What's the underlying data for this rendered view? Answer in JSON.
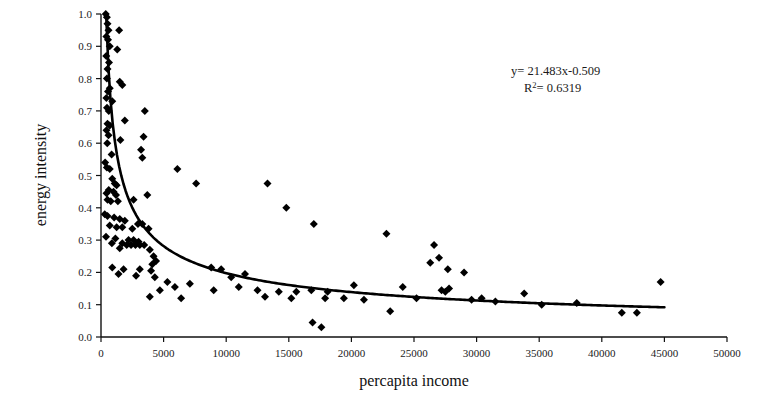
{
  "chart_data": {
    "type": "scatter",
    "title": "",
    "xlabel": "percapita income",
    "ylabel": "energy intensity",
    "xlim": [
      0,
      50000
    ],
    "ylim": [
      0,
      1.0
    ],
    "xticks": [
      0,
      5000,
      10000,
      15000,
      20000,
      25000,
      30000,
      35000,
      40000,
      45000,
      50000
    ],
    "xtick_labels": [
      "0",
      "5000",
      "10000",
      "15000",
      "20000",
      "25000",
      "30000",
      "35000",
      "40000",
      "45000",
      "50000"
    ],
    "yticks": [
      0.0,
      0.1,
      0.2,
      0.3,
      0.4,
      0.5,
      0.6,
      0.7,
      0.8,
      0.9,
      1.0
    ],
    "ytick_labels": [
      "0.0",
      "0.1",
      "0.2",
      "0.3",
      "0.4",
      "0.5",
      "0.6",
      "0.7",
      "0.8",
      "0.9",
      "1.0"
    ],
    "grid": false,
    "legend": "none",
    "marker": "diamond",
    "marker_color": "#000000",
    "marker_size": 4,
    "annotations": {
      "equation_prefix": "y= ",
      "equation_value": "21.483x-0.509",
      "equation": "y= 21.483x-0.509",
      "r_squared_prefix": "R",
      "r_squared_superscript": "2",
      "r_squared_value": "= 0.6319",
      "r_squared": "R2= 0.6319"
    },
    "trendline": {
      "type": "power",
      "coefficient": 21.483,
      "exponent": -0.509,
      "r_squared": 0.6319,
      "color": "#000000",
      "width": 2.6,
      "x_start": 420,
      "x_end": 45000
    },
    "series": [
      {
        "name": "energy intensity vs percapita income",
        "points": [
          [
            380,
            1.0
          ],
          [
            470,
            0.99
          ],
          [
            520,
            0.97
          ],
          [
            600,
            0.95
          ],
          [
            1450,
            0.95
          ],
          [
            430,
            0.93
          ],
          [
            560,
            0.92
          ],
          [
            700,
            0.9
          ],
          [
            1300,
            0.89
          ],
          [
            420,
            0.87
          ],
          [
            640,
            0.85
          ],
          [
            520,
            0.83
          ],
          [
            470,
            0.8
          ],
          [
            1500,
            0.79
          ],
          [
            1700,
            0.78
          ],
          [
            700,
            0.77
          ],
          [
            560,
            0.76
          ],
          [
            430,
            0.74
          ],
          [
            900,
            0.73
          ],
          [
            480,
            0.71
          ],
          [
            620,
            0.7
          ],
          [
            3500,
            0.7
          ],
          [
            1900,
            0.67
          ],
          [
            520,
            0.66
          ],
          [
            700,
            0.655
          ],
          [
            440,
            0.64
          ],
          [
            600,
            0.625
          ],
          [
            3400,
            0.62
          ],
          [
            1550,
            0.61
          ],
          [
            500,
            0.6
          ],
          [
            3200,
            0.58
          ],
          [
            850,
            0.565
          ],
          [
            3300,
            0.555
          ],
          [
            330,
            0.54
          ],
          [
            470,
            0.525
          ],
          [
            700,
            0.52
          ],
          [
            6100,
            0.52
          ],
          [
            900,
            0.49
          ],
          [
            1100,
            0.475
          ],
          [
            1250,
            0.47
          ],
          [
            7600,
            0.475
          ],
          [
            13300,
            0.475
          ],
          [
            620,
            0.455
          ],
          [
            1000,
            0.45
          ],
          [
            440,
            0.445
          ],
          [
            1200,
            0.44
          ],
          [
            3700,
            0.44
          ],
          [
            520,
            0.425
          ],
          [
            780,
            0.42
          ],
          [
            1350,
            0.42
          ],
          [
            2600,
            0.425
          ],
          [
            14800,
            0.4
          ],
          [
            300,
            0.38
          ],
          [
            520,
            0.375
          ],
          [
            1050,
            0.37
          ],
          [
            1500,
            0.365
          ],
          [
            1900,
            0.36
          ],
          [
            2950,
            0.35
          ],
          [
            3300,
            0.35
          ],
          [
            17000,
            0.35
          ],
          [
            700,
            0.345
          ],
          [
            1250,
            0.34
          ],
          [
            1700,
            0.34
          ],
          [
            2500,
            0.335
          ],
          [
            3800,
            0.335
          ],
          [
            22800,
            0.32
          ],
          [
            400,
            0.31
          ],
          [
            1150,
            0.305
          ],
          [
            2200,
            0.3
          ],
          [
            2600,
            0.3
          ],
          [
            3000,
            0.295
          ],
          [
            870,
            0.29
          ],
          [
            1700,
            0.29
          ],
          [
            2050,
            0.285
          ],
          [
            2400,
            0.285
          ],
          [
            2750,
            0.285
          ],
          [
            3100,
            0.285
          ],
          [
            3450,
            0.285
          ],
          [
            26600,
            0.285
          ],
          [
            1500,
            0.275
          ],
          [
            3900,
            0.27
          ],
          [
            4200,
            0.25
          ],
          [
            27000,
            0.245
          ],
          [
            4400,
            0.235
          ],
          [
            26300,
            0.23
          ],
          [
            4100,
            0.225
          ],
          [
            900,
            0.215
          ],
          [
            1800,
            0.21
          ],
          [
            3100,
            0.21
          ],
          [
            4000,
            0.205
          ],
          [
            8800,
            0.215
          ],
          [
            9600,
            0.21
          ],
          [
            27700,
            0.21
          ],
          [
            29000,
            0.2
          ],
          [
            1400,
            0.195
          ],
          [
            2800,
            0.19
          ],
          [
            4300,
            0.185
          ],
          [
            10400,
            0.185
          ],
          [
            11500,
            0.195
          ],
          [
            44700,
            0.17
          ],
          [
            5300,
            0.17
          ],
          [
            7100,
            0.165
          ],
          [
            5900,
            0.155
          ],
          [
            11000,
            0.155
          ],
          [
            20200,
            0.16
          ],
          [
            24100,
            0.155
          ],
          [
            4700,
            0.145
          ],
          [
            9000,
            0.145
          ],
          [
            12500,
            0.145
          ],
          [
            14200,
            0.14
          ],
          [
            15600,
            0.14
          ],
          [
            16800,
            0.145
          ],
          [
            18100,
            0.14
          ],
          [
            27200,
            0.145
          ],
          [
            27500,
            0.14
          ],
          [
            27800,
            0.15
          ],
          [
            33800,
            0.135
          ],
          [
            3900,
            0.125
          ],
          [
            6400,
            0.12
          ],
          [
            13100,
            0.125
          ],
          [
            15200,
            0.12
          ],
          [
            17900,
            0.12
          ],
          [
            19400,
            0.12
          ],
          [
            21000,
            0.115
          ],
          [
            23100,
            0.08
          ],
          [
            25200,
            0.12
          ],
          [
            29600,
            0.115
          ],
          [
            30400,
            0.12
          ],
          [
            31500,
            0.11
          ],
          [
            35200,
            0.1
          ],
          [
            38000,
            0.105
          ],
          [
            41600,
            0.075
          ],
          [
            42800,
            0.075
          ],
          [
            16900,
            0.045
          ],
          [
            17600,
            0.03
          ]
        ]
      }
    ]
  }
}
